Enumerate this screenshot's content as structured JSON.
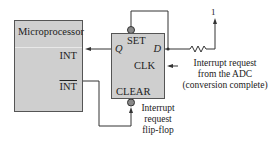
{
  "microprocessor": {
    "title": "Microprocessor",
    "pin_int": "INT",
    "pin_int_bar": "INT"
  },
  "flip_flop": {
    "set": "SET",
    "q": "Q",
    "d": "D",
    "clk": "CLK",
    "clear": "CLEAR",
    "caption_line1": "Interrupt",
    "caption_line2": "request",
    "caption_line3": "flip-flop"
  },
  "clk_source": {
    "line1": "Interrupt request",
    "line2": "from the ADC",
    "line3": "(conversion complete)"
  },
  "supply": {
    "label": "1"
  },
  "colors": {
    "box_fill": "#cfcfcf",
    "line": "#333333"
  }
}
